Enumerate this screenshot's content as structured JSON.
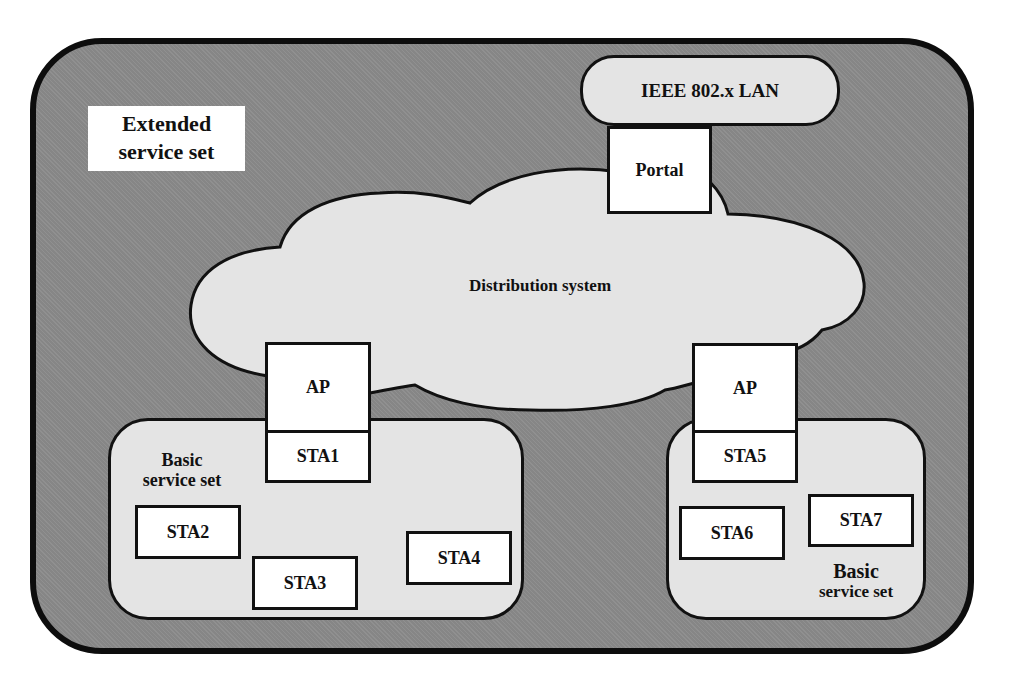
{
  "diagram": {
    "extended_service_set": {
      "label_line1": "Extended",
      "label_line2": "service set"
    },
    "lan": {
      "label": "IEEE 802.x LAN"
    },
    "portal": {
      "label": "Portal"
    },
    "distribution_system": {
      "label": "Distribution system"
    },
    "bss_left": {
      "label_line1": "Basic",
      "label_line2": "service set",
      "ap": "AP",
      "stations": [
        "STA1",
        "STA2",
        "STA3",
        "STA4"
      ]
    },
    "bss_right": {
      "label_line1": "Basic",
      "label_line2": "service set",
      "ap": "AP",
      "stations": [
        "STA5",
        "STA6",
        "STA7"
      ]
    },
    "colors": {
      "ess_fill": "#8a8a8a",
      "light_fill": "#e4e4e4",
      "box_fill": "#ffffff",
      "stroke": "#111111"
    }
  }
}
